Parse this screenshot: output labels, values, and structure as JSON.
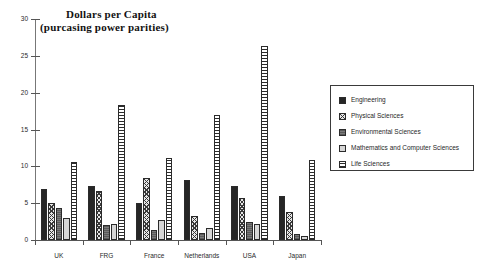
{
  "chart_data": {
    "type": "bar",
    "title": "Dollars per Capita",
    "subtitle": "(purcasing power parities)",
    "xlabel": "",
    "ylabel": "",
    "ylim": [
      0,
      30
    ],
    "yticks": [
      0,
      5,
      10,
      15,
      20,
      25,
      30
    ],
    "ytick_labels": [
      "0",
      "5",
      "10",
      "15",
      "20",
      "25",
      "30"
    ],
    "grid": false,
    "legend_position": "right",
    "categories": [
      "UK",
      "FRG",
      "France",
      "Netherlands",
      "USA",
      "Japan"
    ],
    "series": [
      {
        "name": "Engineering",
        "pattern": "solid-black",
        "color": "#262626",
        "values": [
          6.9,
          7.3,
          5.0,
          8.1,
          7.3,
          6.0
        ]
      },
      {
        "name": "Physical Sciences",
        "pattern": "cross-hatch",
        "color": "#e8e8e8",
        "values": [
          5.0,
          6.6,
          8.4,
          3.3,
          5.7,
          3.8
        ]
      },
      {
        "name": "Environmental Sciences",
        "pattern": "dark-gray",
        "color": "#6e6e6e",
        "values": [
          4.4,
          2.0,
          1.3,
          1.0,
          2.5,
          0.8
        ]
      },
      {
        "name": "Mathematics and Computer Sciences",
        "pattern": "light-gray",
        "color": "#d6d6d6",
        "values": [
          3.0,
          2.2,
          2.7,
          1.6,
          2.2,
          0.6
        ]
      },
      {
        "name": "Life Sciences",
        "pattern": "horizontal-lines",
        "color": "#ffffff",
        "values": [
          10.6,
          18.3,
          11.1,
          17.0,
          26.3,
          10.8
        ]
      }
    ]
  },
  "legend": {
    "items": [
      {
        "label": "Engineering"
      },
      {
        "label": "Physical Sciences"
      },
      {
        "label": "Environmental Sciences"
      },
      {
        "label": "Mathematics and Computer Sciences"
      },
      {
        "label": "Life Sciences"
      }
    ]
  }
}
